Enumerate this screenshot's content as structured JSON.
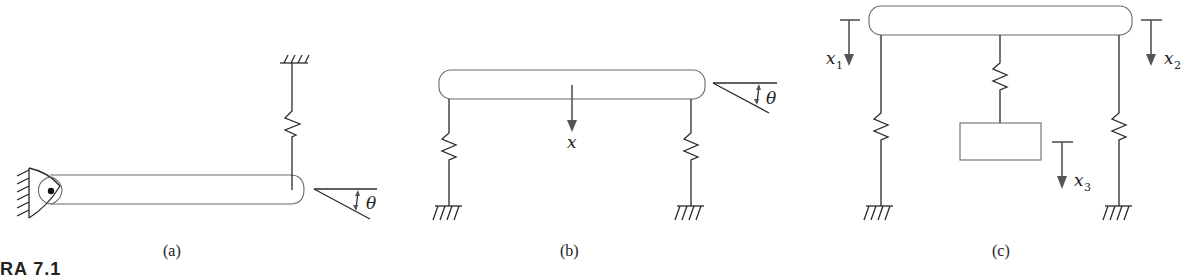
{
  "figure": {
    "caption": "FIGURA 7.1",
    "caption_visible": "URA 7.1"
  },
  "panels": [
    {
      "id": "a",
      "label": "(a)",
      "description": "Bar pinned at left wall, spring to ground above right end, rotation angle",
      "symbols": {
        "angle": "θ"
      }
    },
    {
      "id": "b",
      "label": "(b)",
      "description": "Bar on two springs to ground, translation x and rotation θ",
      "symbols": {
        "displacement": "x",
        "angle": "θ"
      }
    },
    {
      "id": "c",
      "label": "(c)",
      "description": "Bar on two springs with suspended mass via center spring",
      "symbols": {
        "x1": {
          "base": "x",
          "sub": "1"
        },
        "x2": {
          "base": "x",
          "sub": "2"
        },
        "x3": {
          "base": "x",
          "sub": "3"
        }
      }
    }
  ],
  "colors": {
    "stroke": "#2a2a2a",
    "bar_outline": "#6a6a6a",
    "arrow": "#555555",
    "background": "#ffffff"
  }
}
